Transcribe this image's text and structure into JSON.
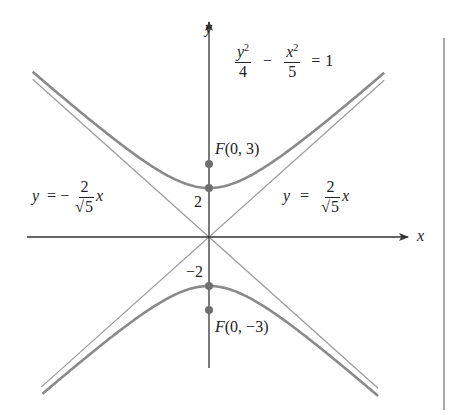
{
  "figure": {
    "equation": {
      "lhs_term1_num_var": "y",
      "lhs_term1_num_exp": "2",
      "lhs_term1_den": "4",
      "minus": "−",
      "lhs_term2_num_var": "x",
      "lhs_term2_num_exp": "2",
      "lhs_term2_den": "5",
      "equals": "=",
      "rhs": "1"
    },
    "axes": {
      "x_label": "x",
      "y_label": "y"
    },
    "asymptote_left": {
      "y": "y",
      "equals": "=",
      "sign": "−",
      "num": "2",
      "root_sym": "√",
      "root_arg": "5",
      "x": "x"
    },
    "asymptote_right": {
      "y": "y",
      "equals": "=",
      "num": "2",
      "root_sym": "√",
      "root_arg": "5",
      "x": "x"
    },
    "vertex_top_label": "2",
    "vertex_bottom_label": "−2",
    "focus_top": {
      "F": "F",
      "coords": "(0, 3)"
    },
    "focus_bottom": {
      "F": "F",
      "coords": "(0, −3)"
    }
  },
  "chart_data": {
    "type": "line",
    "title": "",
    "equation": "y^2/4 - x^2/5 = 1",
    "xlabel": "x",
    "ylabel": "y",
    "series": [
      {
        "name": "hyperbola upper branch",
        "equation": "y = 2*sqrt(1 + x^2/5)"
      },
      {
        "name": "hyperbola lower branch",
        "equation": "y = -2*sqrt(1 + x^2/5)"
      },
      {
        "name": "asymptote",
        "equation": "y = (2/sqrt(5)) x"
      },
      {
        "name": "asymptote",
        "equation": "y = -(2/sqrt(5)) x"
      }
    ],
    "points": [
      {
        "label": "F(0, 3)",
        "x": 0,
        "y": 3,
        "type": "focus"
      },
      {
        "label": "F(0, -3)",
        "x": 0,
        "y": -3,
        "type": "focus"
      },
      {
        "label": "2",
        "x": 0,
        "y": 2,
        "type": "vertex"
      },
      {
        "label": "-2",
        "x": 0,
        "y": -2,
        "type": "vertex"
      }
    ],
    "xlim": [
      -7.5,
      8
    ],
    "ylim": [
      -5.5,
      9.5
    ],
    "grid": false,
    "legend": "none"
  },
  "colors": {
    "axis": "#333333",
    "curve": "#8a8a8a",
    "asymptote": "#9a9a9a",
    "point": "#6f6f6f",
    "frame_line": "#555555"
  }
}
